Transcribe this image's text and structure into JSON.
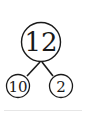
{
  "diagram": {
    "type": "number-bond",
    "whole": {
      "label": "12"
    },
    "parts": [
      {
        "label": "10"
      },
      {
        "label": "2"
      }
    ],
    "colors": {
      "stroke": "#1a1a1a",
      "background": "#ffffff",
      "divider": "#e6e6e6"
    }
  }
}
